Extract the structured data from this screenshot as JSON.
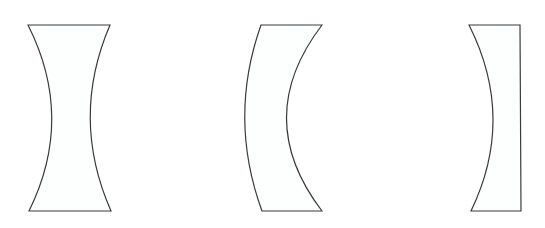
{
  "diagram": {
    "stroke_color": "#3a3a3a",
    "fill_color": "#fdfefe",
    "lenses": [
      {
        "name": "biconcave-lens",
        "path": "M 28 25 L 110 25 Q 70 118 111 211 L 29 211 Q 75 118 28 25 Z"
      },
      {
        "name": "concave-meniscus-lens",
        "path": "M 261 25 L 322 25 Q 251 118 322 211 L 262 211 Q 228 118 261 25 Z"
      },
      {
        "name": "plano-concave-lens",
        "path": "M 469 25 L 520 25 L 521 211 L 471 211 Q 516 118 469 25 Z"
      }
    ]
  }
}
